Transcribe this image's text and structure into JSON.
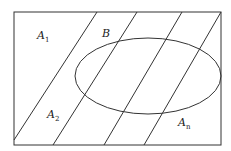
{
  "diagram": {
    "type": "venn-partition",
    "colors": {
      "stroke": "#333333",
      "background": "#ffffff"
    },
    "labels": {
      "a1": {
        "main": "A",
        "sub": "1"
      },
      "b": {
        "main": "B"
      },
      "a2": {
        "main": "A",
        "sub": "2"
      },
      "an": {
        "main": "A",
        "sub": "n"
      }
    }
  }
}
